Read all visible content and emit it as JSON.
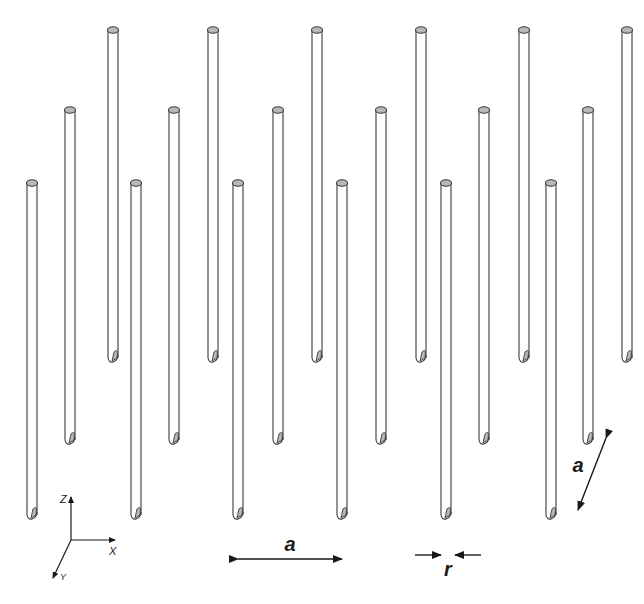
{
  "figure": {
    "type": "photonic crystal rod lattice",
    "background": "#ffffff",
    "line_color": "#3a3a3a",
    "cap_fill": "#b8b8b8",
    "rod_width": 10
  },
  "rods": {
    "back_row": {
      "xs": [
        113,
        213,
        317,
        421,
        524,
        627
      ],
      "top": 30,
      "bottom": 358
    },
    "middle_row": {
      "xs": [
        70,
        174,
        278,
        381,
        484,
        588
      ],
      "top": 110,
      "bottom": 440
    },
    "front_row": {
      "xs": [
        32,
        136,
        238,
        342,
        446,
        551
      ],
      "top": 183,
      "bottom": 515
    }
  },
  "labels": {
    "lattice_constant_x": "a",
    "rod_radius": "r",
    "lattice_constant_y": "a"
  },
  "axes": {
    "z_label": "Z",
    "x_label": "X",
    "y_label": "Y"
  }
}
